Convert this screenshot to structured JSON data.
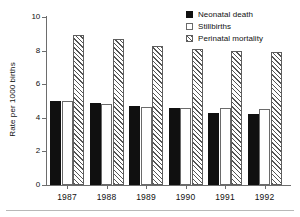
{
  "chart_data": {
    "type": "bar",
    "title": "",
    "subtitle": "",
    "xlabel": "",
    "ylabel": "Rate per 1000 births",
    "categories": [
      "1987",
      "1988",
      "1989",
      "1990",
      "1991",
      "1992"
    ],
    "series": [
      {
        "name": "Neonatal death",
        "values": [
          5.0,
          4.9,
          4.7,
          4.6,
          4.3,
          4.25
        ],
        "fill": "solid-black",
        "color": "#101010"
      },
      {
        "name": "Stillbirths",
        "values": [
          5.0,
          4.8,
          4.65,
          4.6,
          4.6,
          4.55
        ],
        "fill": "white-outline",
        "color": "#ffffff"
      },
      {
        "name": "Perinatal mortality",
        "values": [
          8.9,
          8.7,
          8.3,
          8.1,
          8.0,
          7.9
        ],
        "fill": "diagonal-hatch",
        "color": "#555555"
      }
    ],
    "ylim": [
      0,
      10
    ],
    "yticks": [
      0,
      2,
      4,
      6,
      8,
      10
    ],
    "ytick_labels": [
      "0",
      "2",
      "4",
      "6",
      "8",
      "10"
    ],
    "grid": false,
    "legend_position": "top-right",
    "annotations": []
  },
  "legend": {
    "items": [
      {
        "label": "Neonatal death",
        "swatch": "solid-black-swatch"
      },
      {
        "label": "Stillbirths",
        "swatch": "white-outline-swatch"
      },
      {
        "label": "Perinatal mortality",
        "swatch": "diagonal-hatch-swatch"
      }
    ]
  },
  "axes": {
    "y_title": "Rate per 1000 births",
    "y_labels": [
      "10",
      "8",
      "6",
      "4",
      "2",
      "0"
    ],
    "x_labels": [
      "1987",
      "1988",
      "1989",
      "1990",
      "1991",
      "1992"
    ]
  }
}
